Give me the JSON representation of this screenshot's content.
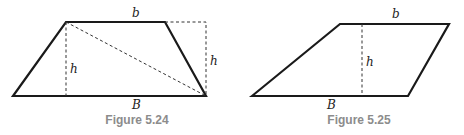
{
  "figures": [
    {
      "caption": "Figure 5.24",
      "shape": "trapezoid",
      "labels": {
        "top_base": "b",
        "bottom_base": "B",
        "height_inner": "h",
        "height_outer": "h"
      },
      "dashed_elements": [
        "inner-height",
        "diagonal",
        "outer-height-box"
      ]
    },
    {
      "caption": "Figure 5.25",
      "shape": "trapezoid",
      "labels": {
        "top_base": "b",
        "bottom_base": "B",
        "height": "h"
      },
      "dashed_elements": [
        "inner-height"
      ]
    }
  ],
  "colors": {
    "stroke": "#1a1a1a",
    "caption": "#8c8c8c"
  }
}
